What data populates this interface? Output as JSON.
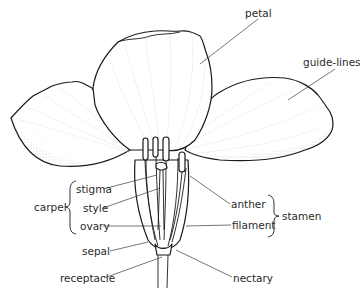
{
  "diagram": {
    "labels": {
      "petal": "petal",
      "guide_lines": "guide-lines",
      "stigma": "stigma",
      "style": "style",
      "ovary": "ovary",
      "carpel": "carpel",
      "sepal": "sepal",
      "receptacle": "receptacle",
      "anther": "anther",
      "filament": "filament",
      "stamen": "stamen",
      "nectary": "nectary"
    },
    "groups": [
      {
        "name": "carpel",
        "members": [
          "stigma",
          "style",
          "ovary"
        ]
      },
      {
        "name": "stamen",
        "members": [
          "anther",
          "filament"
        ]
      }
    ],
    "colors": {
      "line": "#1a1a1a",
      "leader": "#3a3a3a",
      "text": "#2a2a2a",
      "background": "#ffffff"
    }
  }
}
